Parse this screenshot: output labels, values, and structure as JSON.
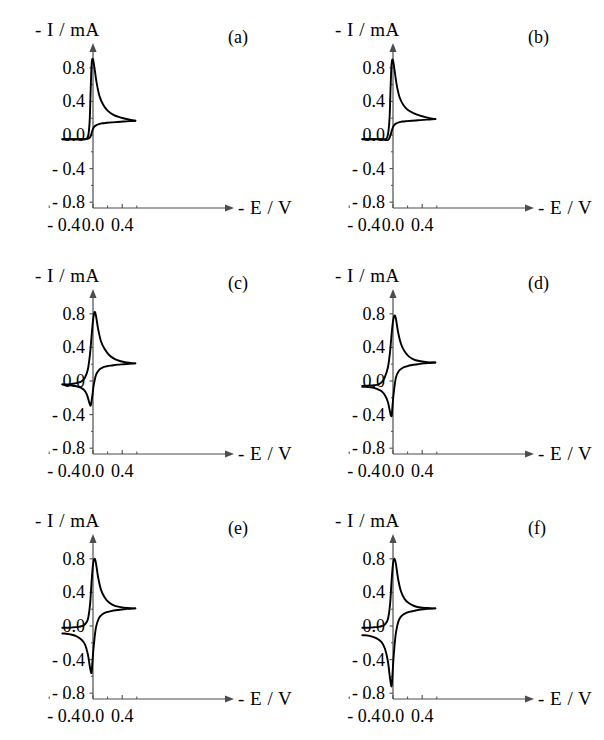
{
  "figure": {
    "axis_labels": {
      "y": "- I / mA",
      "x": "- E / V"
    },
    "y_ticks": [
      "0.8",
      "0.4",
      "0.0",
      "- 0.4",
      "- 0.8"
    ],
    "y_tick_values": [
      0.8,
      0.4,
      0.0,
      -0.4,
      -0.8
    ],
    "x_ticks": [
      "- 0.4",
      "0.0",
      "0.4"
    ],
    "x_tick_values": [
      -0.4,
      0.0,
      0.4
    ],
    "panel_tags": [
      "(a)",
      "(b)",
      "(c)",
      "(d)",
      "(e)",
      "(f)"
    ],
    "line_color": "#000000",
    "axis_color": "#4d4d4d",
    "background": "#ffffff"
  },
  "chart_data": [
    {
      "type": "line",
      "title": "(a)",
      "xlabel": "- E / V",
      "ylabel": "- I / mA",
      "xlim": [
        -0.62,
        0.72
      ],
      "ylim": [
        -1.05,
        1.05
      ],
      "grid": false,
      "legend": "none",
      "anodic_peak": {
        "x": -0.02,
        "y": 0.9
      },
      "cathodic_peak": {
        "x": -0.04,
        "y": -0.03
      },
      "forward_baseline": -0.05,
      "reverse_plateau": 0.17,
      "series": [
        {
          "name": "forward sweep",
          "x": [
            -0.42,
            -0.34,
            -0.26,
            -0.2,
            -0.15,
            -0.11,
            -0.08,
            -0.06,
            -0.045,
            -0.035,
            -0.025,
            -0.015,
            0.0,
            0.02,
            0.05,
            0.09,
            0.14,
            0.2,
            0.28,
            0.37,
            0.46,
            0.54,
            0.58
          ],
          "y": [
            -0.05,
            -0.05,
            -0.05,
            -0.05,
            -0.05,
            -0.05,
            -0.04,
            0.02,
            0.18,
            0.45,
            0.72,
            0.88,
            0.9,
            0.8,
            0.62,
            0.46,
            0.36,
            0.29,
            0.24,
            0.21,
            0.19,
            0.175,
            0.17
          ]
        },
        {
          "name": "reverse sweep",
          "x": [
            0.58,
            0.5,
            0.42,
            0.34,
            0.26,
            0.19,
            0.13,
            0.08,
            0.04,
            0.01,
            -0.01,
            -0.03,
            -0.05,
            -0.08,
            -0.12,
            -0.18,
            -0.26,
            -0.34,
            -0.42
          ],
          "y": [
            0.17,
            0.165,
            0.16,
            0.155,
            0.15,
            0.145,
            0.14,
            0.13,
            0.115,
            0.09,
            0.05,
            -0.01,
            -0.035,
            -0.045,
            -0.05,
            -0.05,
            -0.05,
            -0.05,
            -0.05
          ]
        }
      ]
    },
    {
      "type": "line",
      "title": "(b)",
      "xlabel": "- E / V",
      "ylabel": "- I / mA",
      "xlim": [
        -0.62,
        0.72
      ],
      "ylim": [
        -1.05,
        1.05
      ],
      "grid": false,
      "legend": "none",
      "anodic_peak": {
        "x": -0.01,
        "y": 0.89
      },
      "cathodic_peak": {
        "x": -0.05,
        "y": -0.06
      },
      "forward_baseline": -0.05,
      "reverse_plateau": 0.19,
      "series": [
        {
          "name": "forward sweep",
          "x": [
            -0.42,
            -0.34,
            -0.26,
            -0.2,
            -0.15,
            -0.11,
            -0.08,
            -0.06,
            -0.045,
            -0.035,
            -0.025,
            -0.015,
            0.0,
            0.02,
            0.05,
            0.09,
            0.14,
            0.2,
            0.28,
            0.37,
            0.46,
            0.54,
            0.58
          ],
          "y": [
            -0.05,
            -0.05,
            -0.05,
            -0.05,
            -0.05,
            -0.05,
            -0.03,
            0.06,
            0.24,
            0.52,
            0.76,
            0.88,
            0.89,
            0.78,
            0.6,
            0.45,
            0.36,
            0.3,
            0.26,
            0.23,
            0.21,
            0.195,
            0.19
          ]
        },
        {
          "name": "reverse sweep",
          "x": [
            0.58,
            0.5,
            0.42,
            0.34,
            0.26,
            0.19,
            0.13,
            0.08,
            0.04,
            0.01,
            -0.01,
            -0.03,
            -0.05,
            -0.07,
            -0.1,
            -0.14,
            -0.2,
            -0.28,
            -0.36,
            -0.42
          ],
          "y": [
            0.19,
            0.185,
            0.18,
            0.175,
            0.17,
            0.165,
            0.16,
            0.15,
            0.135,
            0.11,
            0.07,
            0.01,
            -0.04,
            -0.06,
            -0.06,
            -0.055,
            -0.05,
            -0.05,
            -0.05,
            -0.05
          ]
        }
      ]
    },
    {
      "type": "line",
      "title": "(c)",
      "xlabel": "- E / V",
      "ylabel": "- I / mA",
      "xlim": [
        -0.62,
        0.72
      ],
      "ylim": [
        -1.05,
        1.05
      ],
      "grid": false,
      "legend": "none",
      "anodic_peak": {
        "x": 0.02,
        "y": 0.82
      },
      "cathodic_peak": {
        "x": -0.03,
        "y": -0.29
      },
      "forward_baseline": -0.05,
      "reverse_plateau": 0.21,
      "series": [
        {
          "name": "forward sweep",
          "x": [
            -0.42,
            -0.34,
            -0.26,
            -0.2,
            -0.15,
            -0.11,
            -0.07,
            -0.04,
            -0.02,
            0.0,
            0.02,
            0.04,
            0.07,
            0.11,
            0.16,
            0.22,
            0.3,
            0.38,
            0.47,
            0.55,
            0.58
          ],
          "y": [
            -0.04,
            -0.04,
            -0.03,
            -0.02,
            0.0,
            0.04,
            0.14,
            0.33,
            0.53,
            0.72,
            0.82,
            0.78,
            0.62,
            0.47,
            0.38,
            0.31,
            0.26,
            0.235,
            0.22,
            0.21,
            0.21
          ]
        },
        {
          "name": "reverse sweep",
          "x": [
            0.58,
            0.5,
            0.42,
            0.34,
            0.26,
            0.19,
            0.13,
            0.08,
            0.04,
            0.01,
            -0.01,
            -0.03,
            -0.05,
            -0.08,
            -0.12,
            -0.17,
            -0.24,
            -0.32,
            -0.4,
            -0.42
          ],
          "y": [
            0.21,
            0.205,
            0.2,
            0.195,
            0.185,
            0.175,
            0.16,
            0.13,
            0.07,
            -0.05,
            -0.18,
            -0.29,
            -0.26,
            -0.17,
            -0.11,
            -0.08,
            -0.06,
            -0.05,
            -0.045,
            -0.04
          ]
        }
      ]
    },
    {
      "type": "line",
      "title": "(d)",
      "xlabel": "- E / V",
      "ylabel": "- I / mA",
      "xlim": [
        -0.62,
        0.72
      ],
      "ylim": [
        -1.05,
        1.05
      ],
      "grid": false,
      "legend": "none",
      "anodic_peak": {
        "x": 0.02,
        "y": 0.78
      },
      "cathodic_peak": {
        "x": -0.02,
        "y": -0.42
      },
      "forward_baseline": -0.07,
      "reverse_plateau": 0.22,
      "series": [
        {
          "name": "forward sweep",
          "x": [
            -0.42,
            -0.34,
            -0.26,
            -0.2,
            -0.15,
            -0.11,
            -0.07,
            -0.04,
            -0.02,
            0.0,
            0.02,
            0.04,
            0.07,
            0.11,
            0.16,
            0.22,
            0.3,
            0.38,
            0.47,
            0.55,
            0.58
          ],
          "y": [
            -0.06,
            -0.055,
            -0.05,
            -0.04,
            -0.01,
            0.05,
            0.16,
            0.35,
            0.55,
            0.71,
            0.78,
            0.74,
            0.58,
            0.44,
            0.35,
            0.29,
            0.25,
            0.235,
            0.225,
            0.22,
            0.22
          ]
        },
        {
          "name": "reverse sweep",
          "x": [
            0.58,
            0.5,
            0.42,
            0.34,
            0.26,
            0.19,
            0.13,
            0.08,
            0.04,
            0.01,
            -0.01,
            -0.02,
            -0.04,
            -0.07,
            -0.11,
            -0.16,
            -0.23,
            -0.31,
            -0.39,
            -0.42
          ],
          "y": [
            0.22,
            0.215,
            0.21,
            0.2,
            0.19,
            0.175,
            0.155,
            0.12,
            0.04,
            -0.14,
            -0.33,
            -0.42,
            -0.37,
            -0.25,
            -0.17,
            -0.12,
            -0.09,
            -0.075,
            -0.07,
            -0.07
          ]
        }
      ]
    },
    {
      "type": "line",
      "title": "(e)",
      "xlabel": "- E / V",
      "ylabel": "- I / mA",
      "xlim": [
        -0.62,
        0.72
      ],
      "ylim": [
        -1.05,
        1.05
      ],
      "grid": false,
      "legend": "none",
      "anodic_peak": {
        "x": 0.02,
        "y": 0.8
      },
      "cathodic_peak": {
        "x": -0.02,
        "y": -0.56
      },
      "forward_baseline": -0.03,
      "reverse_plateau": 0.21,
      "series": [
        {
          "name": "forward sweep",
          "x": [
            -0.42,
            -0.34,
            -0.26,
            -0.2,
            -0.15,
            -0.11,
            -0.07,
            -0.04,
            -0.02,
            0.0,
            0.02,
            0.04,
            0.07,
            0.11,
            0.16,
            0.22,
            0.3,
            0.38,
            0.47,
            0.55,
            0.58
          ],
          "y": [
            -0.02,
            -0.02,
            -0.015,
            -0.01,
            0.0,
            0.02,
            0.08,
            0.26,
            0.52,
            0.73,
            0.8,
            0.75,
            0.58,
            0.43,
            0.34,
            0.28,
            0.24,
            0.225,
            0.215,
            0.21,
            0.21
          ]
        },
        {
          "name": "reverse sweep",
          "x": [
            0.58,
            0.5,
            0.42,
            0.34,
            0.26,
            0.19,
            0.13,
            0.08,
            0.04,
            0.01,
            -0.01,
            -0.02,
            -0.04,
            -0.07,
            -0.11,
            -0.16,
            -0.23,
            -0.31,
            -0.39,
            -0.42
          ],
          "y": [
            0.21,
            0.205,
            0.2,
            0.19,
            0.18,
            0.165,
            0.14,
            0.09,
            -0.02,
            -0.24,
            -0.45,
            -0.56,
            -0.5,
            -0.34,
            -0.22,
            -0.16,
            -0.12,
            -0.1,
            -0.09,
            -0.09
          ]
        }
      ]
    },
    {
      "type": "line",
      "title": "(f)",
      "xlabel": "- E / V",
      "ylabel": "- I / mA",
      "xlim": [
        -0.62,
        0.72
      ],
      "ylim": [
        -1.05,
        1.05
      ],
      "grid": false,
      "legend": "none",
      "anodic_peak": {
        "x": 0.02,
        "y": 0.8
      },
      "cathodic_peak": {
        "x": -0.02,
        "y": -0.72
      },
      "forward_baseline": -0.02,
      "reverse_plateau": 0.21,
      "series": [
        {
          "name": "forward sweep",
          "x": [
            -0.42,
            -0.34,
            -0.26,
            -0.2,
            -0.15,
            -0.11,
            -0.07,
            -0.04,
            -0.02,
            0.0,
            0.02,
            0.04,
            0.07,
            0.11,
            0.16,
            0.22,
            0.3,
            0.38,
            0.47,
            0.55,
            0.58
          ],
          "y": [
            -0.02,
            -0.02,
            -0.015,
            -0.01,
            0.0,
            0.02,
            0.08,
            0.26,
            0.53,
            0.74,
            0.8,
            0.74,
            0.56,
            0.41,
            0.32,
            0.27,
            0.235,
            0.22,
            0.215,
            0.21,
            0.21
          ]
        },
        {
          "name": "reverse sweep",
          "x": [
            0.58,
            0.5,
            0.42,
            0.34,
            0.26,
            0.19,
            0.13,
            0.08,
            0.04,
            0.01,
            -0.01,
            -0.02,
            -0.04,
            -0.07,
            -0.11,
            -0.16,
            -0.23,
            -0.31,
            -0.39,
            -0.42
          ],
          "y": [
            0.21,
            0.205,
            0.2,
            0.19,
            0.175,
            0.16,
            0.13,
            0.07,
            -0.08,
            -0.35,
            -0.62,
            -0.72,
            -0.63,
            -0.42,
            -0.27,
            -0.19,
            -0.145,
            -0.12,
            -0.11,
            -0.11
          ]
        }
      ]
    }
  ]
}
